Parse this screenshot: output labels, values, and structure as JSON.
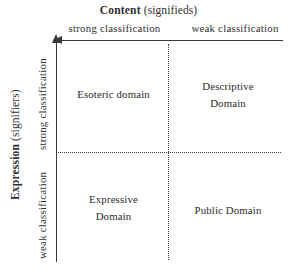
{
  "figure": {
    "type": "two-by-two-matrix",
    "background_color": "#ffffff",
    "ink_color": "#2f2f2f"
  },
  "axes": {
    "horizontal": {
      "heading_main": "Content",
      "heading_sub": "(signifieds)",
      "ticks": [
        "strong classification",
        "weak classification"
      ],
      "tick_left": "strong classification",
      "tick_right": "weak classification",
      "arrow_direction": "left"
    },
    "vertical": {
      "heading_main": "Expression",
      "heading_sub": "(signifiers)",
      "ticks": [
        "strong classification",
        "weak classification"
      ],
      "tick_upper": "strong classification",
      "tick_lower": "weak classification",
      "arrow_direction": "up"
    }
  },
  "quadrants": [
    {
      "id": "top-left",
      "lines": [
        "Esoteric domain"
      ],
      "line1": "Esoteric domain",
      "line2": ""
    },
    {
      "id": "top-right",
      "lines": [
        "Descriptive",
        "Domain"
      ],
      "line1": "Descriptive",
      "line2": "Domain"
    },
    {
      "id": "bottom-left",
      "lines": [
        "Expressive",
        "Domain"
      ],
      "line1": "Expressive",
      "line2": "Domain"
    },
    {
      "id": "bottom-right",
      "lines": [
        "Public Domain"
      ],
      "line1": "Public Domain",
      "line2": ""
    }
  ]
}
